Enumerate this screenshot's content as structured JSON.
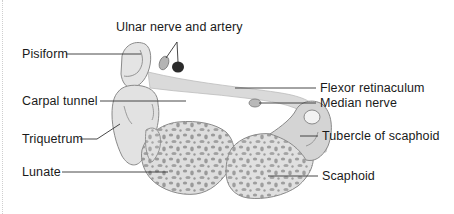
{
  "diagram": {
    "labels": {
      "ulnar": "Ulnar nerve and artery",
      "pisiform": "Pisiform",
      "flexor": "Flexor retinaculum",
      "carpal_tunnel": "Carpal tunnel",
      "median": "Median nerve",
      "triquetrum": "Triquetrum",
      "tubercle": "Tubercle of scaphoid",
      "lunate": "Lunate",
      "scaphoid": "Scaphoid"
    },
    "colors": {
      "bone_fill": "#e4e4e4",
      "bone_outline": "#8a8a8a",
      "cancellous_spots": "#8e8e8e",
      "retinaculum": "#d8d8d8",
      "artery": "#2b2b2b",
      "nerve": "#b4b4b4",
      "leader_line": "#333333",
      "text": "#1a1a1a"
    }
  }
}
